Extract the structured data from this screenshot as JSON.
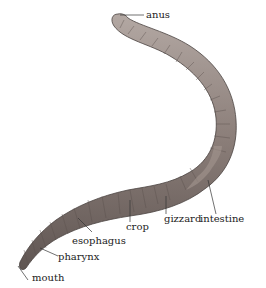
{
  "diagram": {
    "labels": {
      "anus": "anus",
      "intestine": "intestine",
      "gizzard": "gizzard",
      "crop": "crop",
      "esophagus": "esophagus",
      "pharynx": "pharynx",
      "mouth": "mouth"
    },
    "colors": {
      "body": "#8a7d78",
      "body_dark": "#5f5552",
      "body_light": "#b3a8a3",
      "leader": "#333333",
      "text": "#222222"
    }
  }
}
